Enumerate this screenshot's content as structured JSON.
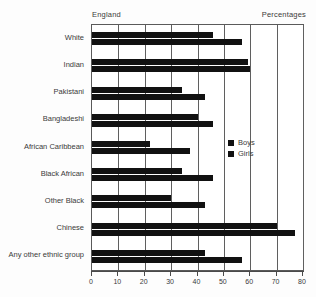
{
  "header": {
    "left_label": "England",
    "right_label": "Percentages"
  },
  "legend": {
    "position": "inside-right",
    "items": [
      {
        "label": "Boys",
        "color": "#111111"
      },
      {
        "label": "Girls",
        "color": "#111111"
      }
    ]
  },
  "axis": {
    "tick_labels": [
      "0",
      "10",
      "20",
      "30",
      "40",
      "50",
      "60",
      "70",
      "80"
    ]
  },
  "chart_data": {
    "type": "bar",
    "orientation": "horizontal",
    "title": "",
    "subtitle": "",
    "xlabel": "Percentages",
    "ylabel": "",
    "xlim": [
      0,
      80
    ],
    "xticks": [
      0,
      10,
      20,
      30,
      40,
      50,
      60,
      70,
      80
    ],
    "grid": true,
    "grid_axis": "x",
    "legend_position": "inside-right",
    "region": "England",
    "categories": [
      "White",
      "Indian",
      "Pakistani",
      "Bangladeshi",
      "African Caribbean",
      "Black African",
      "Other Black",
      "Chinese",
      "Any other  ethnic group"
    ],
    "series": [
      {
        "name": "Boys",
        "color": "#111111",
        "values": [
          46,
          59,
          34,
          40,
          22,
          34,
          30,
          70,
          43
        ]
      },
      {
        "name": "Girls",
        "color": "#111111",
        "values": [
          57,
          60,
          43,
          46,
          37,
          46,
          43,
          77,
          57
        ]
      }
    ]
  }
}
